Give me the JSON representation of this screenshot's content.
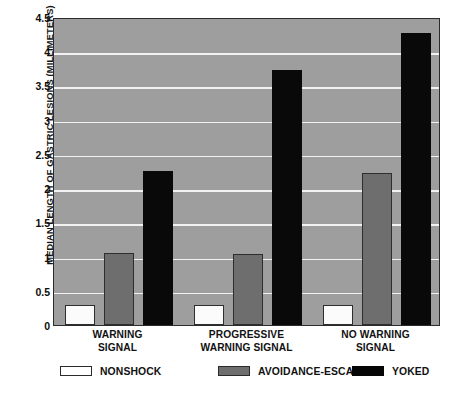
{
  "chart_data": {
    "type": "bar",
    "title": "",
    "xlabel": "",
    "ylabel": "MEDIAN LENGTH OF GASTRIC LESIONS (MILLIMETERS)",
    "ylim": [
      0,
      4.5
    ],
    "yticks": [
      "0",
      "0.5",
      "1",
      "1.5",
      "2",
      "2.5",
      "3",
      "3.5",
      "4",
      "4.5"
    ],
    "ytick_values": [
      0,
      0.5,
      1,
      1.5,
      2,
      2.5,
      3,
      3.5,
      4,
      4.5
    ],
    "grid": "horizontal",
    "legend_position": "bottom",
    "categories": [
      "WARNING SIGNAL",
      "PROGRESSIVE WARNING SIGNAL",
      "NO WARNING SIGNAL"
    ],
    "category_lines": [
      [
        "WARNING",
        "SIGNAL"
      ],
      [
        "PROGRESSIVE",
        "WARNING SIGNAL"
      ],
      [
        "NO WARNING",
        "SIGNAL"
      ]
    ],
    "series": [
      {
        "name": "NONSHOCK",
        "color": "#ffffff",
        "values": [
          0.29,
          0.29,
          0.29
        ]
      },
      {
        "name": "AVOIDANCE-ESCAPE",
        "color": "#6e6e6e",
        "values": [
          1.05,
          1.04,
          2.22
        ]
      },
      {
        "name": "YOKED",
        "color": "#060606",
        "values": [
          2.25,
          3.73,
          4.27
        ]
      }
    ],
    "plot_background": "#9e9e9e",
    "gridline_color": "#f2f2f2"
  },
  "legend": {
    "items": [
      {
        "label": "NONSHOCK",
        "swatch": "nonshock"
      },
      {
        "label": "AVOIDANCE-ESCAPE",
        "swatch": "avoid"
      },
      {
        "label": "YOKED",
        "swatch": "yoked"
      }
    ]
  },
  "caption_strip": {
    "text": ""
  }
}
